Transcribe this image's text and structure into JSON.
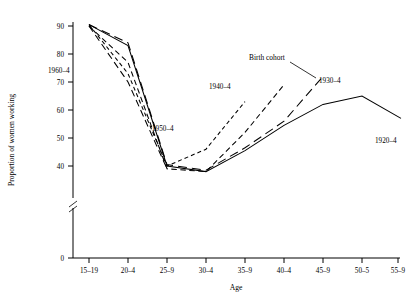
{
  "chart_data": {
    "type": "line",
    "title": "",
    "xlabel": "Age",
    "ylabel": "Proportion of women working",
    "categories": [
      "15–19",
      "20–4",
      "25–9",
      "30–4",
      "35–9",
      "40–4",
      "45–9",
      "50–5",
      "55–9"
    ],
    "ylim": [
      0,
      93
    ],
    "yticks": [
      0,
      40,
      50,
      60,
      70,
      80,
      90
    ],
    "ytick_labels": [
      "0",
      "40",
      "50",
      "60",
      "70",
      "80",
      "90"
    ],
    "axis_break": true,
    "axis_break_note": "y-axis broken between 0 and 40",
    "grid": false,
    "legend_position": "inline-labels",
    "annotations": [
      {
        "text": "Birth cohort",
        "target": "1930–4"
      }
    ],
    "series": [
      {
        "name": "1960–4",
        "label": "1960–4",
        "dash": "long-dash",
        "x": [
          "15–19",
          "20–4",
          "25–9"
        ],
        "values": [
          90,
          70,
          39
        ]
      },
      {
        "name": "1950–4",
        "label": "1950–4",
        "dash": "short-dash",
        "x": [
          "15–19",
          "20–4",
          "25–9",
          "30–4",
          "35–9"
        ],
        "values": [
          90.5,
          73,
          40,
          46,
          63
        ]
      },
      {
        "name": "1940–4",
        "label": "1940–4",
        "dash": "medium-dash",
        "x": [
          "15–19",
          "20–4",
          "25–9",
          "30–4",
          "35–9",
          "40–4"
        ],
        "values": [
          90,
          77,
          39,
          38,
          52,
          69
        ]
      },
      {
        "name": "1930–4",
        "label": "1930–4",
        "dash": "long-dash",
        "x": [
          "15–19",
          "20–4",
          "25–9",
          "30–4",
          "35–9",
          "40–4",
          "45–9"
        ],
        "values": [
          90.5,
          84,
          40.5,
          38.5,
          46.5,
          56,
          72
        ]
      },
      {
        "name": "1920–4",
        "label": "1920–4",
        "dash": "solid",
        "x": [
          "15–19",
          "20–4",
          "25–9",
          "30–4",
          "35–9",
          "40–4",
          "45–9",
          "50–5",
          "55–9"
        ],
        "values": [
          90.5,
          83,
          40,
          38,
          45.5,
          54.5,
          62,
          65,
          57
        ]
      }
    ]
  },
  "labels": {
    "birth_cohort": "Birth cohort",
    "s1960": "1960–4",
    "s1950": "1950–4",
    "s1940": "1940–4",
    "s1930": "1930–4",
    "s1920": "1920–4",
    "xaxis": "Age",
    "yaxis": "Proportion of women working",
    "x0": "15–19",
    "x1": "20–4",
    "x2": "25–9",
    "x3": "30–4",
    "x4": "35–9",
    "x5": "40–4",
    "x6": "45–9",
    "x7": "50–5",
    "x8": "55–9",
    "y0": "0",
    "y40": "40",
    "y50": "50",
    "y60": "60",
    "y70": "70",
    "y80": "80",
    "y90": "90"
  },
  "colors": {
    "ink": "#000000",
    "background": "#ffffff"
  }
}
